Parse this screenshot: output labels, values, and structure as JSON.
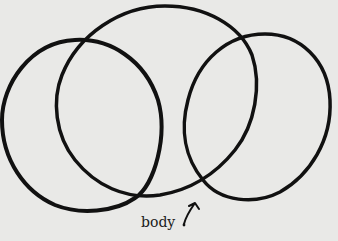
{
  "diagram": {
    "shapes": [
      {
        "name": "left-oval",
        "type": "closed-curve"
      },
      {
        "name": "center-oval",
        "type": "closed-curve"
      },
      {
        "name": "right-oval",
        "type": "closed-curve"
      }
    ],
    "annotation": {
      "label": "body",
      "points_to": "intersection of center-oval and right-oval"
    },
    "colors": {
      "background": "#e9e9e7",
      "stroke": "#111111"
    }
  }
}
